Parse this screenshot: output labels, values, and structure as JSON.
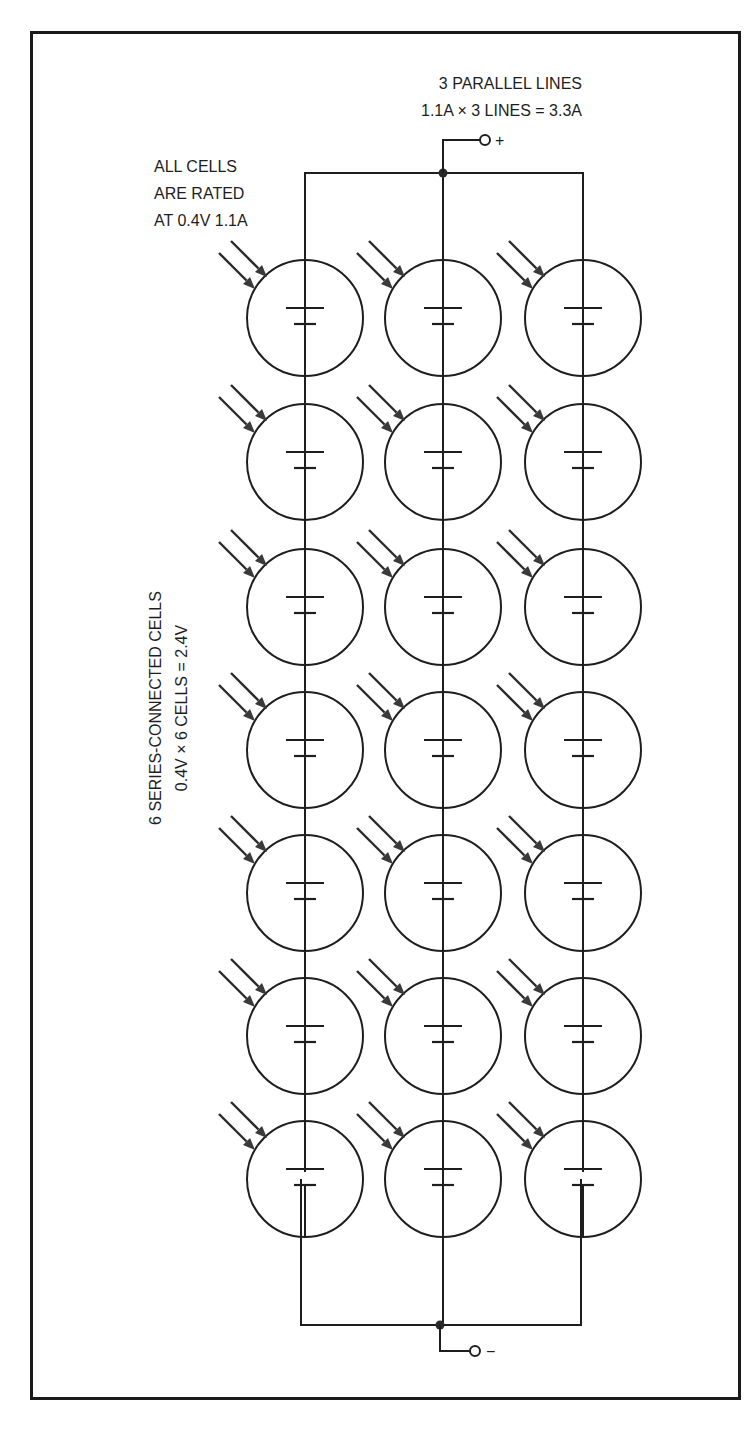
{
  "diagram": {
    "title_parallel": "3 PARALLEL LINES",
    "parallel_formula": "1.1A × 3 LINES = 3.3A",
    "rating_note": [
      "ALL CELLS",
      "ARE RATED",
      "AT 0.4V 1.1A"
    ],
    "series_label": "6 SERIES-CONNECTED CELLS",
    "series_formula": "0.4V × 6 CELLS = 2.4V",
    "positive_terminal": "+",
    "negative_terminal": "−",
    "columns": 3,
    "rows": 7,
    "cell_symbol": "battery-cell-icon",
    "light_symbol": "light-arrows-icon",
    "colors": {
      "ink": "#1e1e1e",
      "background": "#ffffff"
    }
  }
}
